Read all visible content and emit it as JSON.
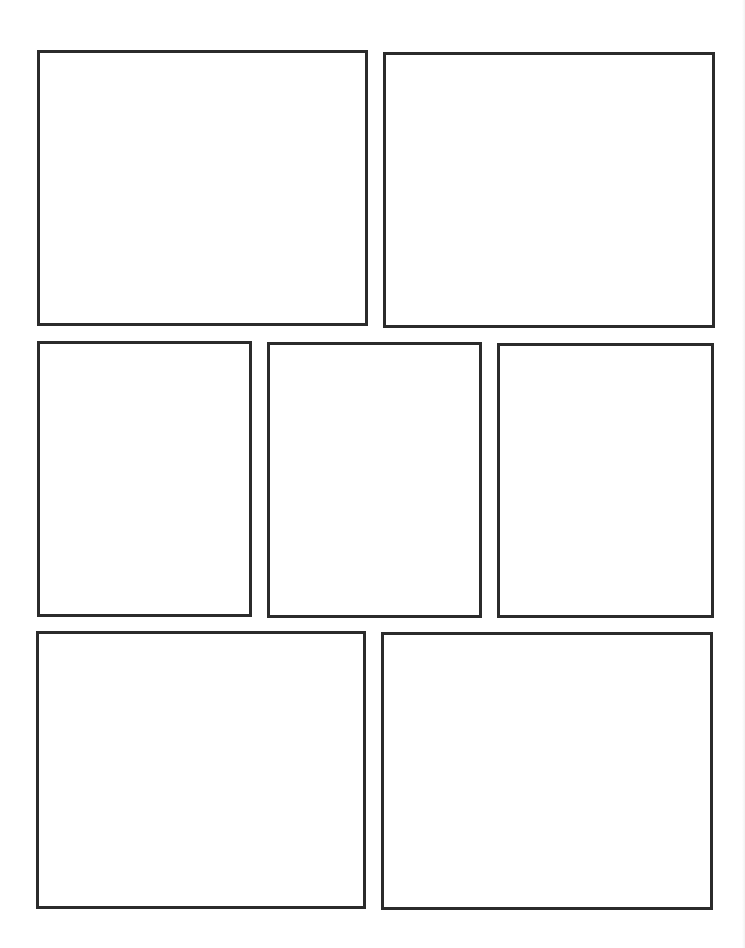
{
  "page": {
    "type": "comic-panel-template",
    "width": 745,
    "height": 948,
    "background": "#ffffff",
    "border_color": "#2b2b2b",
    "border_width": 3
  },
  "rows": [
    {
      "row": 1,
      "panels": [
        {
          "id": "panel-1",
          "x": 37,
          "y": 50,
          "w": 331,
          "h": 276
        },
        {
          "id": "panel-2",
          "x": 383,
          "y": 52,
          "w": 332,
          "h": 276
        }
      ]
    },
    {
      "row": 2,
      "panels": [
        {
          "id": "panel-3",
          "x": 37,
          "y": 341,
          "w": 215,
          "h": 276
        },
        {
          "id": "panel-4",
          "x": 267,
          "y": 342,
          "w": 215,
          "h": 276
        },
        {
          "id": "panel-5",
          "x": 497,
          "y": 343,
          "w": 217,
          "h": 275
        }
      ]
    },
    {
      "row": 3,
      "panels": [
        {
          "id": "panel-6",
          "x": 36,
          "y": 631,
          "w": 330,
          "h": 278
        },
        {
          "id": "panel-7",
          "x": 381,
          "y": 632,
          "w": 332,
          "h": 278
        }
      ]
    }
  ]
}
